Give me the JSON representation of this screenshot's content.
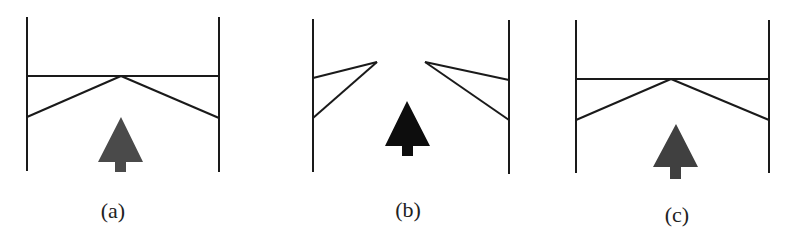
{
  "figure": {
    "colors": {
      "line": "#1a1a1a",
      "arrow_a": "#4a4a4a",
      "arrow_b": "#0d0d0d",
      "arrow_c": "#404040",
      "label": "#222222",
      "background": "#ffffff"
    },
    "panels": [
      {
        "id": "a",
        "label": "(a)",
        "state": "closed gate with V-shaped brace",
        "arrow_icon": "up-arrow"
      },
      {
        "id": "b",
        "label": "(b)",
        "state": "open gate, flaps folded to walls",
        "arrow_icon": "up-arrow"
      },
      {
        "id": "c",
        "label": "(c)",
        "state": "closed gate with V-shaped brace",
        "arrow_icon": "up-arrow"
      }
    ]
  }
}
